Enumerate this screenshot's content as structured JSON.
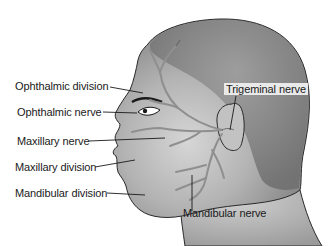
{
  "diagram": {
    "labels": {
      "ophthalmic_division": "Ophthalmic division",
      "ophthalmic_nerve": "Ophthalmic nerve",
      "maxillary_nerve": "Maxillary nerve",
      "maxillary_division": "Maxillary division",
      "mandibular_division": "Mandibular division",
      "trigeminal_nerve": "Trigeminal nerve",
      "mandibular_nerve": "Mandibular nerve"
    },
    "colors": {
      "skin_dark": "#7a7a7a",
      "skin_mid": "#a5a5a5",
      "skin_light": "#d0d0d0",
      "nerve": "#9a9a9a",
      "outline": "#2a2a2a",
      "label_bg": "#e9e9e9"
    }
  }
}
